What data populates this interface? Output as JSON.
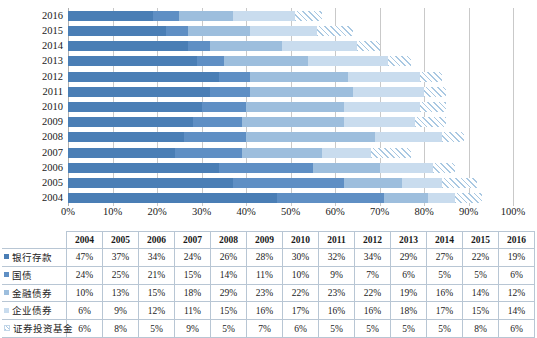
{
  "chart_data": {
    "type": "bar",
    "orientation": "horizontal",
    "stacked": "100%",
    "title": "",
    "xlabel": "",
    "ylabel": "",
    "xlim": [
      0,
      100
    ],
    "grid": true,
    "legend_position": "table-row-headers",
    "categories": [
      "2016",
      "2015",
      "2014",
      "2013",
      "2012",
      "2011",
      "2010",
      "2009",
      "2008",
      "2007",
      "2006",
      "2005",
      "2004"
    ],
    "table_categories": [
      "2004",
      "2005",
      "2006",
      "2007",
      "2008",
      "2009",
      "2010",
      "2011",
      "2012",
      "2013",
      "2014",
      "2015",
      "2016"
    ],
    "xticks": [
      "0%",
      "10%",
      "20%",
      "30%",
      "40%",
      "50%",
      "60%",
      "70%",
      "80%",
      "90%",
      "100%"
    ],
    "xtick_values": [
      0,
      10,
      20,
      30,
      40,
      50,
      60,
      70,
      80,
      90,
      100
    ],
    "series": [
      {
        "name": "银行存款",
        "color": "#4a7eb5",
        "icon": "legend-square-icon",
        "values": [
          47,
          37,
          34,
          24,
          26,
          28,
          30,
          32,
          34,
          29,
          27,
          22,
          19
        ],
        "labels": [
          "47%",
          "37%",
          "34%",
          "24%",
          "26%",
          "28%",
          "30%",
          "32%",
          "34%",
          "29%",
          "27%",
          "22%",
          "19%"
        ]
      },
      {
        "name": "国债",
        "color": "#5f8fc4",
        "icon": "legend-square-icon",
        "values": [
          24,
          25,
          21,
          15,
          14,
          11,
          10,
          9,
          7,
          6,
          5,
          5,
          6
        ],
        "labels": [
          "24%",
          "25%",
          "21%",
          "15%",
          "14%",
          "11%",
          "10%",
          "9%",
          "7%",
          "6%",
          "5%",
          "5%",
          "6%"
        ]
      },
      {
        "name": "金融债券",
        "color": "#9dbedd",
        "icon": "legend-square-icon",
        "values": [
          10,
          13,
          15,
          18,
          29,
          23,
          22,
          23,
          22,
          19,
          16,
          14,
          12
        ],
        "labels": [
          "10%",
          "13%",
          "15%",
          "18%",
          "29%",
          "23%",
          "22%",
          "23%",
          "22%",
          "19%",
          "16%",
          "14%",
          "12%"
        ]
      },
      {
        "name": "企业债券",
        "color": "#c9dcee",
        "icon": "legend-square-icon",
        "values": [
          6,
          9,
          12,
          11,
          15,
          16,
          17,
          16,
          16,
          18,
          17,
          15,
          14
        ],
        "labels": [
          "6%",
          "9%",
          "12%",
          "11%",
          "15%",
          "16%",
          "17%",
          "16%",
          "16%",
          "18%",
          "17%",
          "15%",
          "14%"
        ]
      },
      {
        "name": "证券投资基金",
        "color": "#a9c8e2",
        "pattern": "diagonal-hatch",
        "icon": "legend-square-hatch-icon",
        "values": [
          6,
          8,
          5,
          9,
          5,
          7,
          6,
          5,
          5,
          5,
          5,
          8,
          6
        ],
        "labels": [
          "6%",
          "8%",
          "5%",
          "9%",
          "5%",
          "7%",
          "6%",
          "5%",
          "5%",
          "5%",
          "5%",
          "8%",
          "6%"
        ]
      }
    ]
  }
}
